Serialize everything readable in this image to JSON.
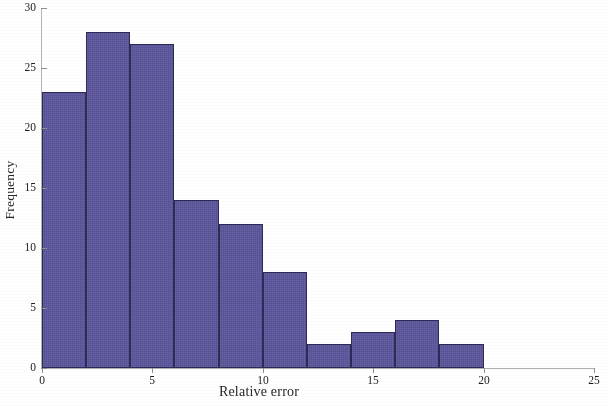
{
  "chart_data": {
    "type": "bar",
    "title": "",
    "subtitle": "",
    "xlabel": "Relative error",
    "ylabel": "Frequency",
    "bin_width": 2,
    "bin_edges": [
      0,
      2,
      4,
      6,
      8,
      10,
      12,
      14,
      16,
      18,
      20
    ],
    "categories": [
      "0-2",
      "2-4",
      "4-6",
      "6-8",
      "8-10",
      "10-12",
      "12-14",
      "14-16",
      "16-18",
      "18-20"
    ],
    "values": [
      23,
      28,
      27,
      14,
      12,
      8,
      2,
      3,
      4,
      2
    ],
    "xlim": [
      0,
      25
    ],
    "ylim": [
      0,
      30
    ],
    "xticks": [
      0,
      5,
      10,
      15,
      20,
      25
    ],
    "xtick_labels": [
      "0",
      "5",
      "10",
      "15",
      "20",
      "25"
    ],
    "yticks": [
      0,
      5,
      10,
      15,
      20,
      25,
      30
    ],
    "ytick_labels": [
      "0",
      "5",
      "10",
      "15",
      "20",
      "25",
      "30"
    ],
    "grid": false,
    "legend": null,
    "bar_color": "#5a549c",
    "bar_edge_color": "#2e2a55",
    "axis_color": "#b0b0b0",
    "background": "#ffffff"
  }
}
